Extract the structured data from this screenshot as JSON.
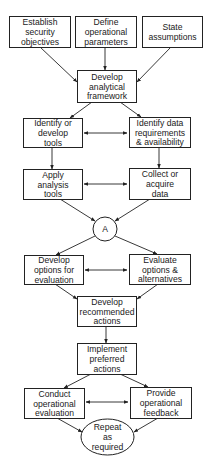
{
  "diagram": {
    "type": "flowchart",
    "colors": {
      "stroke": "#222222",
      "text": "#1a1a1a",
      "background": "#ffffff"
    },
    "nodes": [
      {
        "id": "n1",
        "shape": "rect",
        "lines": [
          "Establish",
          "security",
          "objectives"
        ],
        "x": 9,
        "y": 16,
        "w": 61,
        "h": 31
      },
      {
        "id": "n2",
        "shape": "rect",
        "lines": [
          "Define",
          "operational",
          "parameters"
        ],
        "x": 75,
        "y": 16,
        "w": 61,
        "h": 31
      },
      {
        "id": "n3",
        "shape": "rect",
        "lines": [
          "State",
          "assumptions"
        ],
        "x": 142,
        "y": 16,
        "w": 60,
        "h": 31
      },
      {
        "id": "n4",
        "shape": "rect",
        "lines": [
          "Develop",
          "analytical",
          "framework"
        ],
        "x": 77,
        "y": 70,
        "w": 59,
        "h": 32
      },
      {
        "id": "n5",
        "shape": "rect",
        "lines": [
          "Identify or",
          "develop",
          "tools"
        ],
        "x": 23,
        "y": 118,
        "w": 59,
        "h": 29
      },
      {
        "id": "n6",
        "shape": "rect",
        "lines": [
          "Identify data",
          "requirements",
          "& availability"
        ],
        "x": 129,
        "y": 117,
        "w": 61,
        "h": 30
      },
      {
        "id": "n7",
        "shape": "rect",
        "lines": [
          "Apply",
          "analysis",
          "tools"
        ],
        "x": 23,
        "y": 169,
        "w": 59,
        "h": 30
      },
      {
        "id": "n8",
        "shape": "rect",
        "lines": [
          "Collect or",
          "acquire",
          "data"
        ],
        "x": 129,
        "y": 168,
        "w": 61,
        "h": 31
      },
      {
        "id": "nA",
        "shape": "circle",
        "lines": [
          "A"
        ],
        "cx": 105,
        "cy": 229,
        "r": 12
      },
      {
        "id": "n9",
        "shape": "rect",
        "lines": [
          "Develop",
          "options for",
          "evaluation"
        ],
        "x": 24,
        "y": 255,
        "w": 59,
        "h": 29
      },
      {
        "id": "n10",
        "shape": "rect",
        "lines": [
          "Evaluate",
          "options &",
          "alternatives"
        ],
        "x": 129,
        "y": 254,
        "w": 61,
        "h": 30
      },
      {
        "id": "n11",
        "shape": "rect",
        "lines": [
          "Develop",
          "recommended",
          "actions"
        ],
        "x": 77,
        "y": 296,
        "w": 59,
        "h": 30
      },
      {
        "id": "n12",
        "shape": "rect",
        "lines": [
          "Implement",
          "preferred",
          "actions"
        ],
        "x": 77,
        "y": 343,
        "w": 59,
        "h": 31
      },
      {
        "id": "n13",
        "shape": "rect",
        "lines": [
          "Conduct",
          "operational",
          "evaluation"
        ],
        "x": 24,
        "y": 388,
        "w": 60,
        "h": 30
      },
      {
        "id": "n14",
        "shape": "rect",
        "lines": [
          "Provide",
          "operational",
          "feedback"
        ],
        "x": 130,
        "y": 387,
        "w": 61,
        "h": 31
      },
      {
        "id": "n15",
        "shape": "ellipse",
        "lines": [
          "Repeat",
          "as",
          "required"
        ],
        "cx": 107.5,
        "cy": 437,
        "rx": 26.5,
        "ry": 18
      }
    ],
    "edges": [
      {
        "from": "n1",
        "to": "n4",
        "x1": 40,
        "y1": 47,
        "x2": 77,
        "y2": 82
      },
      {
        "from": "n2",
        "to": "n4",
        "x1": 105,
        "y1": 47,
        "x2": 105,
        "y2": 70
      },
      {
        "from": "n3",
        "to": "n4",
        "x1": 171,
        "y1": 47,
        "x2": 137,
        "y2": 82
      },
      {
        "from": "n4",
        "to": "n5",
        "x1": 92,
        "y1": 102,
        "x2": 70,
        "y2": 118
      },
      {
        "from": "n4",
        "to": "n6",
        "x1": 120,
        "y1": 102,
        "x2": 141,
        "y2": 117
      },
      {
        "from": "n5",
        "to": "n6",
        "x1": 84,
        "y1": 133,
        "x2": 127,
        "y2": 133,
        "bidirectional": true
      },
      {
        "from": "n5",
        "to": "n7",
        "x1": 52,
        "y1": 147,
        "x2": 52,
        "y2": 169
      },
      {
        "from": "n6",
        "to": "n8",
        "x1": 159,
        "y1": 147,
        "x2": 159,
        "y2": 168
      },
      {
        "from": "n7",
        "to": "n8",
        "x1": 84,
        "y1": 184,
        "x2": 127,
        "y2": 184,
        "bidirectional": true
      },
      {
        "from": "n7",
        "to": "nA",
        "x1": 60,
        "y1": 199,
        "x2": 95,
        "y2": 221
      },
      {
        "from": "n8",
        "to": "nA",
        "x1": 150,
        "y1": 199,
        "x2": 115,
        "y2": 221
      },
      {
        "from": "nA",
        "to": "n9",
        "x1": 95,
        "y1": 236,
        "x2": 56,
        "y2": 255
      },
      {
        "from": "nA",
        "to": "n10",
        "x1": 115,
        "y1": 236,
        "x2": 157,
        "y2": 254
      },
      {
        "from": "n9",
        "to": "n10",
        "x1": 85,
        "y1": 270,
        "x2": 127,
        "y2": 270,
        "bidirectional": true
      },
      {
        "from": "n9",
        "to": "n11",
        "x1": 55,
        "y1": 284,
        "x2": 77,
        "y2": 299
      },
      {
        "from": "n10",
        "to": "n11",
        "x1": 158,
        "y1": 284,
        "x2": 137,
        "y2": 299
      },
      {
        "from": "n11",
        "to": "n12",
        "x1": 106,
        "y1": 326,
        "x2": 106,
        "y2": 343
      },
      {
        "from": "n12",
        "to": "n13",
        "x1": 91,
        "y1": 374,
        "x2": 64,
        "y2": 388
      },
      {
        "from": "n12",
        "to": "n14",
        "x1": 120,
        "y1": 374,
        "x2": 148,
        "y2": 387
      },
      {
        "from": "n13",
        "to": "n14",
        "x1": 86,
        "y1": 402,
        "x2": 128,
        "y2": 402,
        "bidirectional": true
      },
      {
        "from": "n13",
        "to": "n15",
        "x1": 57,
        "y1": 418,
        "x2": 82,
        "y2": 432
      },
      {
        "from": "n14",
        "to": "n15",
        "x1": 158,
        "y1": 418,
        "x2": 134,
        "y2": 432
      }
    ]
  }
}
